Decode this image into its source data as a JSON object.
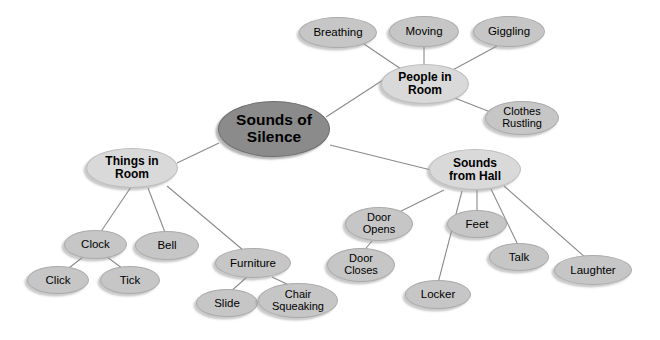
{
  "diagram": {
    "type": "mind-map",
    "title": "Sounds of Silence",
    "background_color": "#ffffff",
    "colors": {
      "central_fill": "#8b8b8b",
      "branch_fill": "#d9d9d9",
      "leaf_fill": "#c6c6c6",
      "edge": "#8a8a8a",
      "text": "#000000"
    },
    "nodes": {
      "center": "Sounds of\nSilence",
      "people_in_room": "People in\nRoom",
      "breathing": "Breathing",
      "moving": "Moving",
      "giggling": "Giggling",
      "clothes_rustling": "Clothes\nRustling",
      "things_in_room": "Things in\nRoom",
      "clock": "Clock",
      "click": "Click",
      "tick": "Tick",
      "bell": "Bell",
      "furniture": "Furniture",
      "slide": "Slide",
      "chair_squeaking": "Chair\nSqueaking",
      "sounds_from_hall": "Sounds\nfrom Hall",
      "door_opens": "Door\nOpens",
      "door_closes": "Door\nCloses",
      "locker": "Locker",
      "feet": "Feet",
      "talk": "Talk",
      "laughter": "Laughter"
    },
    "edges": [
      [
        "center",
        "people_in_room"
      ],
      [
        "center",
        "things_in_room"
      ],
      [
        "center",
        "sounds_from_hall"
      ],
      [
        "people_in_room",
        "breathing"
      ],
      [
        "people_in_room",
        "moving"
      ],
      [
        "people_in_room",
        "giggling"
      ],
      [
        "people_in_room",
        "clothes_rustling"
      ],
      [
        "things_in_room",
        "clock"
      ],
      [
        "things_in_room",
        "bell"
      ],
      [
        "things_in_room",
        "furniture"
      ],
      [
        "clock",
        "click"
      ],
      [
        "clock",
        "tick"
      ],
      [
        "furniture",
        "slide"
      ],
      [
        "furniture",
        "chair_squeaking"
      ],
      [
        "sounds_from_hall",
        "door_opens"
      ],
      [
        "sounds_from_hall",
        "locker"
      ],
      [
        "sounds_from_hall",
        "feet"
      ],
      [
        "sounds_from_hall",
        "talk"
      ],
      [
        "sounds_from_hall",
        "laughter"
      ],
      [
        "door_opens",
        "door_closes"
      ]
    ]
  }
}
